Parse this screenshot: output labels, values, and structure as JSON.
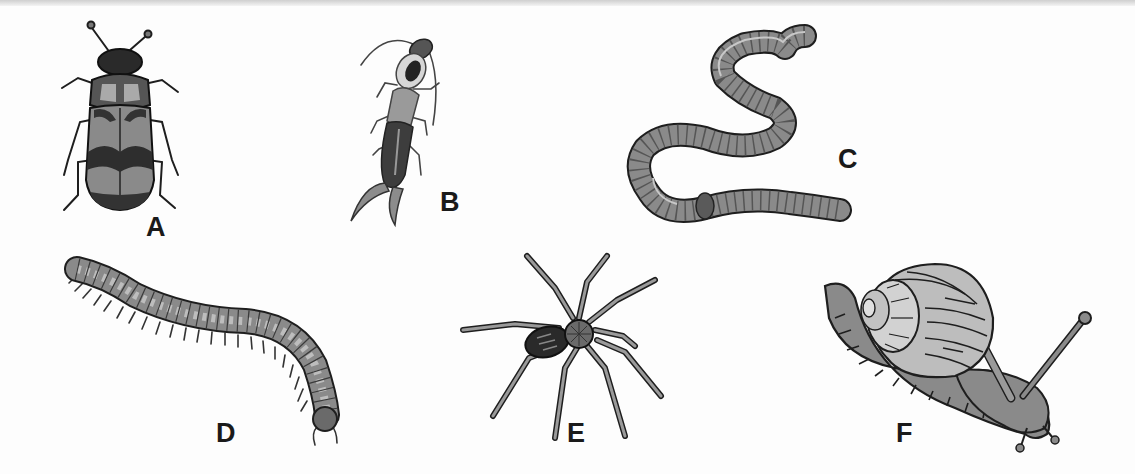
{
  "figure": {
    "type": "labeled-illustration",
    "panels": [
      {
        "id": "A",
        "label": "A",
        "organism": "beetle-icon"
      },
      {
        "id": "B",
        "label": "B",
        "organism": "earwig-icon"
      },
      {
        "id": "C",
        "label": "C",
        "organism": "earthworm-icon"
      },
      {
        "id": "D",
        "label": "D",
        "organism": "millipede-icon"
      },
      {
        "id": "E",
        "label": "E",
        "organism": "spider-icon"
      },
      {
        "id": "F",
        "label": "F",
        "organism": "snail-icon"
      }
    ]
  },
  "colors": {
    "outline": "#1e1e1e",
    "fill_mid": "#8a8a8a",
    "fill_light": "#b8b8b8",
    "fill_dark": "#3a3a3a",
    "background": "#fdfdfd"
  }
}
